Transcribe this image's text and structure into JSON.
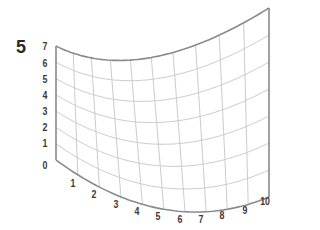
{
  "figure": {
    "panel_label": "5",
    "y_axis_labels": [
      "0",
      "1",
      "2",
      "3",
      "4",
      "5",
      "6",
      "7"
    ],
    "x_axis_labels": [
      "1",
      "2",
      "3",
      "4",
      "5",
      "6",
      "7",
      "8",
      "9",
      "10"
    ],
    "colors": {
      "grid_line": "#cccccc",
      "border_line": "#8a8a8a",
      "label": "#3a3a3a"
    }
  }
}
